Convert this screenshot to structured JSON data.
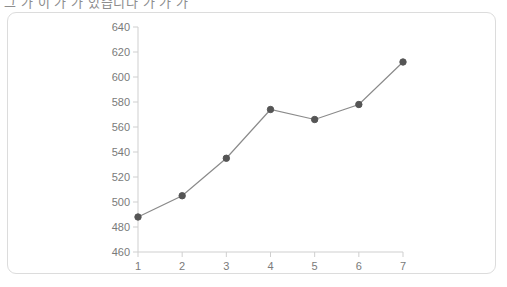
{
  "caption": {
    "text": "그 가 이 가 가 있습니다 가 가 가"
  },
  "colors": {
    "card_border": "#dcdcdc",
    "card_background": "#ffffff",
    "axis": "#cfcfcf",
    "tick_label": "#7a7a7a",
    "line": "#8a8a8a",
    "marker": "#555555"
  },
  "chart_data": {
    "type": "line",
    "title": "",
    "xlabel": "",
    "ylabel": "",
    "x": [
      1,
      2,
      3,
      4,
      5,
      6,
      7
    ],
    "values": [
      488,
      505,
      535,
      574,
      566,
      578,
      612
    ],
    "xtick_labels": [
      "1",
      "2",
      "3",
      "4",
      "5",
      "6",
      "7"
    ],
    "ytick_labels": [
      "640",
      "620",
      "600",
      "580",
      "560",
      "540",
      "520",
      "500",
      "480",
      "460"
    ],
    "yticks": [
      640,
      620,
      600,
      580,
      560,
      540,
      520,
      500,
      480,
      460
    ],
    "ylim": [
      460,
      640
    ],
    "xlim": [
      1,
      7
    ],
    "grid": false,
    "legend": false,
    "markers": true
  }
}
